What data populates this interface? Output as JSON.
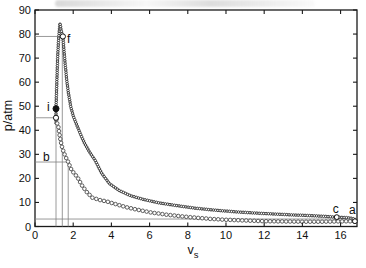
{
  "figure": {
    "ylabel": "p/atm",
    "xlabel_main": "v",
    "xlabel_sub": "s"
  },
  "colors": {
    "curve": "#2b2b2b",
    "lower_marker_stroke": "#4d4d4d",
    "guide": "#808080",
    "axis": "#1a1a1a",
    "text": "#111111",
    "background": "#ffffff"
  },
  "chart_data": {
    "type": "line",
    "title": "",
    "xlabel": "v_s",
    "ylabel": "p/atm",
    "xlim": [
      0,
      16.86
    ],
    "ylim": [
      0,
      90
    ],
    "xticks": [
      0,
      2,
      4,
      6,
      8,
      10,
      12,
      14,
      16
    ],
    "yticks": [
      0,
      10,
      20,
      30,
      40,
      50,
      60,
      70,
      80,
      90
    ],
    "grid": false,
    "legend": "none",
    "series": [
      {
        "name": "upper-path-i-f-c-a",
        "style": "line+markers",
        "marker_radius": 1.25,
        "marker_spacing_px": 2.3,
        "points": [
          [
            1.1,
            43
          ],
          [
            1.1,
            49
          ],
          [
            1.13,
            57
          ],
          [
            1.16,
            64
          ],
          [
            1.19,
            71
          ],
          [
            1.23,
            77
          ],
          [
            1.27,
            81
          ],
          [
            1.31,
            84.5
          ],
          [
            1.36,
            82
          ],
          [
            1.41,
            80.3
          ],
          [
            1.46,
            79
          ],
          [
            1.51,
            74
          ],
          [
            1.58,
            67.5
          ],
          [
            1.66,
            61
          ],
          [
            1.76,
            55
          ],
          [
            1.88,
            49.5
          ],
          [
            2.0,
            46
          ],
          [
            2.12,
            43.5
          ],
          [
            2.25,
            41
          ],
          [
            2.4,
            38
          ],
          [
            2.6,
            34.5
          ],
          [
            2.85,
            31
          ],
          [
            3.15,
            27.5
          ],
          [
            3.5,
            22
          ],
          [
            3.9,
            17.8
          ],
          [
            4.4,
            15
          ],
          [
            5.0,
            12.8
          ],
          [
            5.7,
            11.2
          ],
          [
            6.5,
            9.8
          ],
          [
            7.4,
            8.7
          ],
          [
            8.4,
            7.6
          ],
          [
            9.4,
            6.8
          ],
          [
            10.5,
            6.1
          ],
          [
            11.5,
            5.6
          ],
          [
            12.5,
            5.2
          ],
          [
            13.5,
            4.8
          ],
          [
            14.5,
            4.5
          ],
          [
            15.2,
            4.2
          ],
          [
            15.8,
            3.9
          ],
          [
            16.3,
            3.7
          ],
          [
            16.6,
            3.4
          ],
          [
            16.75,
            3.0
          ],
          [
            16.82,
            2.6
          ],
          [
            16.78,
            2.2
          ]
        ]
      },
      {
        "name": "lower-path-a-b-i",
        "style": "markers",
        "marker_radius": 1.8,
        "marker_spacing_px": 4.0,
        "points": [
          [
            1.12,
            44.5
          ],
          [
            1.16,
            43
          ],
          [
            1.22,
            41.5
          ],
          [
            1.31,
            37
          ],
          [
            1.4,
            33.5
          ],
          [
            1.52,
            30.5
          ],
          [
            1.63,
            28.5
          ],
          [
            1.74,
            26.8
          ],
          [
            1.88,
            24
          ],
          [
            2.05,
            22
          ],
          [
            2.2,
            20.8
          ],
          [
            2.45,
            17.2
          ],
          [
            2.7,
            14.4
          ],
          [
            3.0,
            12
          ],
          [
            3.4,
            11
          ],
          [
            3.8,
            10.3
          ],
          [
            4.3,
            9.1
          ],
          [
            4.8,
            8.0
          ],
          [
            5.4,
            6.9
          ],
          [
            6.1,
            5.8
          ],
          [
            6.9,
            4.9
          ],
          [
            7.7,
            4.2
          ],
          [
            8.5,
            3.6
          ],
          [
            9.3,
            3.1
          ],
          [
            10.0,
            2.8
          ],
          [
            11.0,
            2.5
          ],
          [
            12.0,
            2.2
          ],
          [
            13.0,
            2.1
          ],
          [
            14.0,
            2.0
          ],
          [
            15.0,
            2.0
          ],
          [
            15.8,
            2.1
          ],
          [
            16.4,
            2.15
          ],
          [
            16.75,
            2.2
          ]
        ]
      }
    ],
    "state_points": [
      {
        "id": "i",
        "x": 1.1,
        "y": 49.0,
        "marker": "filled",
        "r": 3.0
      },
      {
        "id": "i-start",
        "x": 1.1,
        "y": 45.2,
        "marker": "open",
        "r": 2.6
      },
      {
        "id": "f",
        "x": 1.46,
        "y": 79.0,
        "marker": "open",
        "r": 2.6
      },
      {
        "id": "c",
        "x": 15.8,
        "y": 3.9,
        "marker": "open",
        "r": 2.4
      },
      {
        "id": "a",
        "x": 16.75,
        "y": 2.2,
        "marker": "open",
        "r": 2.4
      }
    ],
    "annotations": [
      {
        "text": "i",
        "x": 0.7,
        "y": 49.5
      },
      {
        "text": "f",
        "x": 1.76,
        "y": 78.0
      },
      {
        "text": "b",
        "x": 0.6,
        "y": 28.8
      },
      {
        "text": "c",
        "x": 15.75,
        "y": 7.3
      },
      {
        "text": "a",
        "x": 16.62,
        "y": 7.0
      }
    ],
    "guide_lines": [
      {
        "type": "h",
        "p": 79.0,
        "v0": 0,
        "v1": 1.46
      },
      {
        "type": "h",
        "p": 45.2,
        "v0": 0,
        "v1": 1.1
      },
      {
        "type": "h",
        "p": 26.8,
        "v0": 0,
        "v1": 1.74
      },
      {
        "type": "h",
        "p": 3.1,
        "v0": 0,
        "v1": 16.4
      },
      {
        "type": "v",
        "v": 1.1,
        "p0": 0,
        "p1": 45.2
      },
      {
        "type": "v",
        "v": 1.43,
        "p0": 0,
        "p1": 79.0
      },
      {
        "type": "v",
        "v": 1.74,
        "p0": 0,
        "p1": 26.8
      }
    ]
  }
}
